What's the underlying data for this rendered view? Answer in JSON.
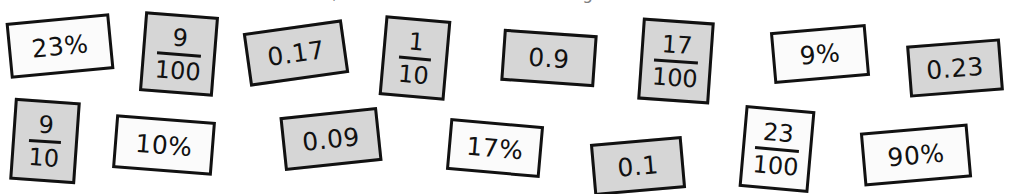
{
  "heading": {
    "text": "Cut out the cards below, then sort them into matching sets. Each value has three cards."
  },
  "colors": {
    "card_gray": "#d6d6d6",
    "card_white": "#fbfbfb",
    "outline": "#111111",
    "page_background": "#ffffff"
  },
  "cards": [
    {
      "id": "card-23-percent",
      "kind": "percent",
      "text": "23%",
      "shade": "white",
      "orientation": "landscape"
    },
    {
      "id": "card-9-over-100",
      "kind": "fraction",
      "numerator": "9",
      "denominator": "100",
      "shade": "gray",
      "orientation": "portrait"
    },
    {
      "id": "card-0-17",
      "kind": "decimal",
      "text": "0.17",
      "shade": "gray",
      "orientation": "landscape"
    },
    {
      "id": "card-1-over-10",
      "kind": "fraction",
      "numerator": "1",
      "denominator": "10",
      "shade": "gray",
      "orientation": "portrait"
    },
    {
      "id": "card-0-9",
      "kind": "decimal",
      "text": "0.9",
      "shade": "gray",
      "orientation": "landscape"
    },
    {
      "id": "card-17-over-100",
      "kind": "fraction",
      "numerator": "17",
      "denominator": "100",
      "shade": "gray",
      "orientation": "portrait"
    },
    {
      "id": "card-9-percent",
      "kind": "percent",
      "text": "9%",
      "shade": "white",
      "orientation": "landscape"
    },
    {
      "id": "card-0-23",
      "kind": "decimal",
      "text": "0.23",
      "shade": "gray",
      "orientation": "landscape"
    },
    {
      "id": "card-9-over-10",
      "kind": "fraction",
      "numerator": "9",
      "denominator": "10",
      "shade": "gray",
      "orientation": "portrait"
    },
    {
      "id": "card-10-percent",
      "kind": "percent",
      "text": "10%",
      "shade": "white",
      "orientation": "landscape"
    },
    {
      "id": "card-0-09",
      "kind": "decimal",
      "text": "0.09",
      "shade": "gray",
      "orientation": "landscape"
    },
    {
      "id": "card-17-percent",
      "kind": "percent",
      "text": "17%",
      "shade": "white",
      "orientation": "landscape"
    },
    {
      "id": "card-0-1",
      "kind": "decimal",
      "text": "0.1",
      "shade": "gray",
      "orientation": "landscape"
    },
    {
      "id": "card-23-over-100",
      "kind": "fraction",
      "numerator": "23",
      "denominator": "100",
      "shade": "white",
      "orientation": "portrait"
    },
    {
      "id": "card-90-percent",
      "kind": "percent",
      "text": "90%",
      "shade": "white",
      "orientation": "landscape"
    }
  ]
}
